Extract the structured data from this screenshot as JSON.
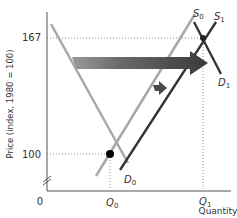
{
  "diagram": {
    "type": "supply-demand",
    "y_axis_label": "Price (index, 1980 = 100)",
    "x_axis_label": "Quantity",
    "y_ticks": [
      {
        "value": 167,
        "label": "167"
      },
      {
        "value": 100,
        "label": "100"
      }
    ],
    "origin_label": "0",
    "x_ticks": [
      {
        "label": "Q",
        "sub": "0"
      },
      {
        "label": "Q",
        "sub": "1"
      }
    ],
    "curves": {
      "D0": {
        "label": "D",
        "sub": "0",
        "color": "#a8a8a8"
      },
      "S0": {
        "label": "S",
        "sub": "0",
        "color": "#a8a8a8"
      },
      "S1": {
        "label": "S",
        "sub": "1",
        "color": "#333333"
      },
      "D1": {
        "label": "D",
        "sub": "1",
        "color": "#333333"
      }
    },
    "equilibria": [
      {
        "name": "initial",
        "price": 100,
        "quantity": "Q0"
      },
      {
        "name": "new",
        "price": 167,
        "quantity": "Q1"
      }
    ],
    "arrows": [
      {
        "name": "large-shift-arrow",
        "direction": "right",
        "meaning": "demand increase"
      },
      {
        "name": "small-shift-arrow",
        "direction": "right",
        "meaning": "supply increase"
      }
    ],
    "colors": {
      "axis": "#555555",
      "guide": "#777777",
      "arrow_dark": "#3a3a3a",
      "arrow_light": "#9a9a9a",
      "point": "#000000"
    }
  }
}
